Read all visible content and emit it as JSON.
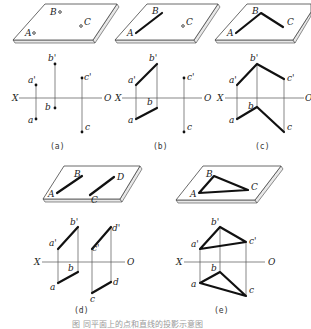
{
  "figure": {
    "caption": "图     同平面上的点和直线的投影示意图",
    "panels": [
      {
        "id": "a",
        "label": "(a)",
        "plate_labels": {
          "A": "A",
          "B": "B",
          "C": "C"
        },
        "axis": {
          "x": "X",
          "o": "O"
        },
        "projection_labels": {
          "a_prime": "a'",
          "b_prime": "b'",
          "c_prime": "c'",
          "a": "a",
          "b": "b",
          "c": "c"
        },
        "description": "Three separate points A, B, C on a plane"
      },
      {
        "id": "b",
        "label": "(b)",
        "plate_labels": {
          "A": "A",
          "B": "B",
          "C": "C"
        },
        "axis": {
          "x": "X",
          "o": "O"
        },
        "projection_labels": {
          "a_prime": "a'",
          "b_prime": "b'",
          "c_prime": "c'",
          "a": "a",
          "b": "b",
          "c": "c"
        },
        "description": "Line AB and point C"
      },
      {
        "id": "c",
        "label": "(c)",
        "plate_labels": {
          "A": "A",
          "B": "B",
          "C": "C"
        },
        "axis": {
          "x": "X",
          "o": "O"
        },
        "projection_labels": {
          "a_prime": "a'",
          "b_prime": "b'",
          "c_prime": "c'",
          "a": "a",
          "b": "b",
          "c": "c"
        },
        "description": "Intersecting lines AB and BC"
      },
      {
        "id": "d",
        "label": "(d)",
        "plate_labels": {
          "A": "A",
          "B": "B",
          "C": "C",
          "D": "D"
        },
        "axis": {
          "x": "X",
          "o": "O"
        },
        "projection_labels": {
          "a_prime": "a'",
          "b_prime": "b'",
          "c_prime": "c'",
          "d_prime": "d'",
          "a": "a",
          "b": "b",
          "c": "c",
          "d": "d"
        },
        "description": "Parallel lines AB and CD"
      },
      {
        "id": "e",
        "label": "(e)",
        "plate_labels": {
          "A": "A",
          "B": "B",
          "C": "C"
        },
        "axis": {
          "x": "X",
          "o": "O"
        },
        "projection_labels": {
          "a_prime": "a'",
          "b_prime": "b'",
          "c_prime": "c'",
          "a": "a",
          "b": "b",
          "c": "c"
        },
        "description": "Triangle ABC"
      }
    ]
  }
}
